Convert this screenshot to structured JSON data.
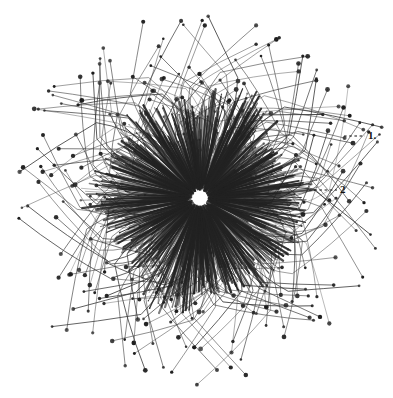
{
  "figure": {
    "kind": "scientific-illustration",
    "background_color": "#ffffff",
    "ink_color": "#1a1a1a",
    "width": 393,
    "height": 398
  },
  "organism": {
    "center": {
      "x": 200,
      "y": 198
    },
    "core": {
      "name": "spicule-core",
      "radius": 100,
      "description": "dense radial burst of short dark spicules",
      "spicule_count": 900,
      "inner_radius": 8,
      "color": "#222222"
    },
    "filaments": {
      "name": "axopodia",
      "count": 230,
      "min_radius": 95,
      "max_radius": 185,
      "tip_knob_radius": 1.8,
      "color": "#3a3a3a",
      "description": "long curved filaments each ending in a small dark terminal knob"
    }
  },
  "labels": [
    {
      "id": "1",
      "text": "1.",
      "x": 368,
      "y": 130,
      "leader": {
        "x1": 344,
        "y1": 136,
        "x2": 365,
        "y2": 136,
        "style": "dashed"
      },
      "points_to": "outer-filament-zone"
    },
    {
      "id": "2",
      "text": "2",
      "x": 340,
      "y": 184,
      "leader": {
        "x1": 309,
        "y1": 190,
        "x2": 337,
        "y2": 190,
        "style": "dashed"
      },
      "points_to": "spicule-core"
    }
  ]
}
